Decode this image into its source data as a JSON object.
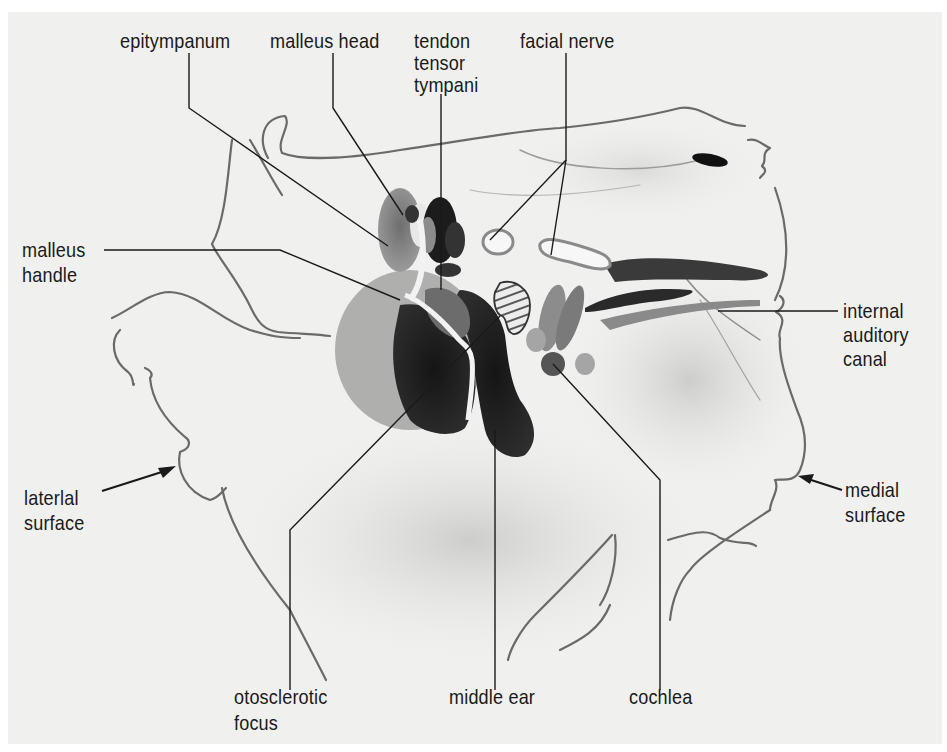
{
  "figure": {
    "type": "anatomical-illustration",
    "background_color": "#f0f0ee",
    "ink_color": "#1a1a1a"
  },
  "labels": {
    "epitympanum": "epitympanum",
    "malleus_head": "malleus head",
    "tendon_tensor_tympani_1": "tendon",
    "tendon_tensor_tympani_2": "tensor",
    "tendon_tensor_tympani_3": "tympani",
    "facial_nerve": "facial nerve",
    "malleus_handle_1": "malleus",
    "malleus_handle_2": "handle",
    "internal_auditory_canal_1": "internal",
    "internal_auditory_canal_2": "auditory",
    "internal_auditory_canal_3": "canal",
    "lateral_surface_1": "laterlal",
    "lateral_surface_2": "surface",
    "medial_surface_1": "medial",
    "medial_surface_2": "surface",
    "otosclerotic_focus_1": "otosclerotic",
    "otosclerotic_focus_2": "focus",
    "middle_ear": "middle ear",
    "cochlea": "cochlea"
  }
}
